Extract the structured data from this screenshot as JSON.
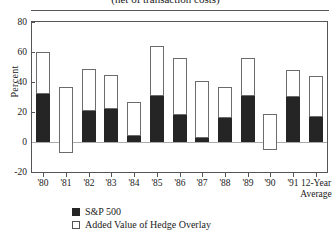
{
  "chart_data": {
    "type": "bar",
    "title": "(net of transaction costs)",
    "xlabel": "",
    "ylabel": "Percent",
    "ylim": [
      -20,
      80
    ],
    "yticks": [
      -20,
      0,
      20,
      40,
      60,
      80
    ],
    "ytick_labels": [
      "-20",
      "0",
      "20",
      "40",
      "60",
      "80"
    ],
    "grid": false,
    "stacked": true,
    "legend_position": "bottom-left",
    "categories": [
      "'80",
      "'81",
      "'82",
      "'83",
      "'84",
      "'85",
      "'86",
      "'87",
      "'88",
      "'89",
      "'90",
      "'91",
      "12-Year Average"
    ],
    "series": [
      {
        "name": "S&P 500",
        "color": "#252525",
        "values": [
          32,
          -7,
          21,
          22,
          4,
          31,
          18,
          3,
          16,
          31,
          -5,
          30,
          17
        ]
      },
      {
        "name": "Added Value of Hedge Overlay",
        "color": "#ffffff",
        "values": [
          28,
          44,
          28,
          23,
          23,
          33,
          38,
          38,
          21,
          25,
          24,
          18,
          27
        ]
      }
    ],
    "totals": [
      60,
      37,
      49,
      45,
      27,
      64,
      56,
      41,
      37,
      56,
      19,
      48,
      44
    ]
  },
  "legend": [
    {
      "label": "S&P 500",
      "swatch": "filled-square-icon"
    },
    {
      "label": "Added Value of Hedge Overlay",
      "swatch": "open-square-icon"
    }
  ]
}
